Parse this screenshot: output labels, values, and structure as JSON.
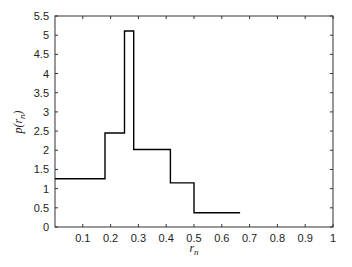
{
  "chart_data": {
    "type": "line",
    "subtype": "step",
    "title": "",
    "xlabel": "r_n",
    "ylabel": "p(r_n)",
    "xlim": [
      0,
      1
    ],
    "ylim": [
      0,
      5.5
    ],
    "xticks": [
      0.1,
      0.2,
      0.3,
      0.4,
      0.5,
      0.6,
      0.7,
      0.8,
      0.9,
      1
    ],
    "xtick_labels": [
      "0.1",
      "0.2",
      "0.3",
      "0.4",
      "0.5",
      "0.6",
      "0.7",
      "0.8",
      "0.9",
      "1"
    ],
    "yticks": [
      0,
      0.5,
      1,
      1.5,
      2,
      2.5,
      3,
      3.5,
      4,
      4.5,
      5,
      5.5
    ],
    "ytick_labels": [
      "0",
      "0.5",
      "1",
      "1.5",
      "2",
      "2.5",
      "3",
      "3.5",
      "4",
      "4.5",
      "5",
      "5.5"
    ],
    "grid": false,
    "legend": null,
    "box": true,
    "series": [
      {
        "name": "p(r_n)",
        "color": "#000000",
        "steps": [
          {
            "x_start": 0.0,
            "x_end": 0.18,
            "y": 1.26
          },
          {
            "x_start": 0.18,
            "x_end": 0.25,
            "y": 2.45
          },
          {
            "x_start": 0.25,
            "x_end": 0.283,
            "y": 5.11
          },
          {
            "x_start": 0.283,
            "x_end": 0.415,
            "y": 2.02
          },
          {
            "x_start": 0.415,
            "x_end": 0.5,
            "y": 1.15
          },
          {
            "x_start": 0.5,
            "x_end": 0.666,
            "y": 0.37
          }
        ]
      }
    ]
  },
  "labels": {
    "x_axis": "r",
    "x_axis_sub": "n",
    "y_axis": "p(r",
    "y_axis_sub": "n",
    "y_axis_close": ")"
  },
  "colors": {
    "axis": "#333333",
    "line": "#000000",
    "background": "#ffffff"
  }
}
